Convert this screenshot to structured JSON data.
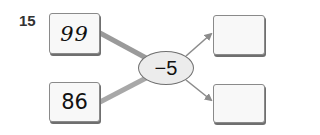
{
  "problem": {
    "number": "15",
    "inputs": [
      "99",
      "86"
    ],
    "operation": "−5",
    "outputs": [
      "",
      ""
    ]
  },
  "colors": {
    "connector": "#9a9a9a",
    "arrow": "#8c8c8c",
    "box_border": "#8a8a8a",
    "ellipse_fill": "#ececec"
  }
}
